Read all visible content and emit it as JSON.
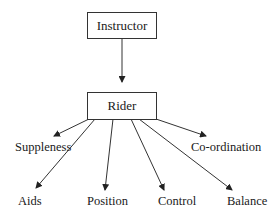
{
  "diagram": {
    "type": "hierarchy",
    "top_node": "Instructor",
    "middle_node": "Rider",
    "edges": [
      {
        "from": "Instructor",
        "to": "Rider"
      },
      {
        "from": "Rider",
        "to": "Suppleness"
      },
      {
        "from": "Rider",
        "to": "Aids"
      },
      {
        "from": "Rider",
        "to": "Position"
      },
      {
        "from": "Rider",
        "to": "Control"
      },
      {
        "from": "Rider",
        "to": "Balance"
      },
      {
        "from": "Rider",
        "to": "Co-ordination"
      }
    ],
    "leaves": {
      "suppleness": "Suppleness",
      "coordination": "Co-ordination",
      "aids": "Aids",
      "position": "Position",
      "control": "Control",
      "balance": "Balance"
    },
    "colors": {
      "line": "#333333",
      "text": "#1a1a1a",
      "background": "#ffffff"
    }
  }
}
